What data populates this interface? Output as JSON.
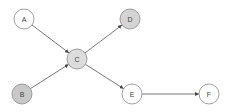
{
  "diagram": {
    "type": "directed-graph",
    "nodes": [
      {
        "id": "A",
        "label": "A",
        "fill": "#ffffff"
      },
      {
        "id": "B",
        "label": "B",
        "fill": "#c8c8c8"
      },
      {
        "id": "C",
        "label": "C",
        "fill": "#dcdcdc"
      },
      {
        "id": "D",
        "label": "D",
        "fill": "#d4d4d4"
      },
      {
        "id": "E",
        "label": "E",
        "fill": "#ffffff"
      },
      {
        "id": "F",
        "label": "F",
        "fill": "#ffffff"
      }
    ],
    "edges": [
      {
        "from": "A",
        "to": "C"
      },
      {
        "from": "B",
        "to": "C"
      },
      {
        "from": "C",
        "to": "D"
      },
      {
        "from": "C",
        "to": "E"
      },
      {
        "from": "E",
        "to": "F"
      }
    ]
  }
}
